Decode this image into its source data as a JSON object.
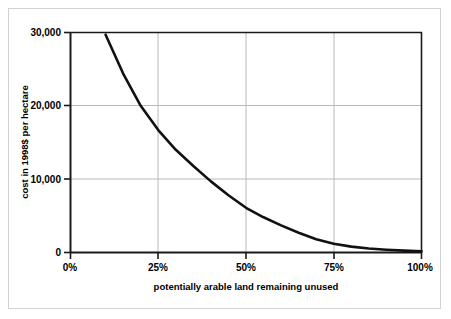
{
  "chart_data": {
    "type": "line",
    "title": "",
    "xlabel": "potentially arable land remaining unused",
    "ylabel": "cost in 1998$ per hectare",
    "xlim": [
      0,
      100
    ],
    "ylim": [
      0,
      30000
    ],
    "grid": true,
    "legend": null,
    "x_tick_labels": [
      "0%",
      "25%",
      "50%",
      "75%",
      "100%"
    ],
    "x_tick_values": [
      0,
      25,
      50,
      75,
      100
    ],
    "y_tick_labels": [
      "0",
      "10,000",
      "20,000",
      "30,000"
    ],
    "y_tick_values": [
      0,
      10000,
      20000,
      30000
    ],
    "series": [
      {
        "name": "cost of converting land",
        "color": "#111111",
        "x": [
          10,
          15,
          20,
          25,
          30,
          35,
          40,
          45,
          50,
          55,
          60,
          65,
          70,
          75,
          80,
          85,
          90,
          95,
          100
        ],
        "y": [
          29700,
          24400,
          20000,
          16700,
          14000,
          11800,
          9700,
          7800,
          6100,
          4800,
          3700,
          2700,
          1800,
          1200,
          800,
          550,
          380,
          250,
          150
        ]
      }
    ]
  },
  "axis": {
    "y_label_text": "cost in 1998$ per hectare",
    "x_label_text": "potentially arable land remaining unused"
  },
  "colors": {
    "curve": "#111111",
    "axis": "#1a1a1a",
    "grid": "#b9b9b9",
    "outer_border": "#d2d2d2",
    "background": "#ffffff"
  }
}
